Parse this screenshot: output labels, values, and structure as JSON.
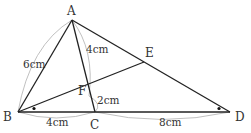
{
  "diagram": {
    "type": "geometry-figure",
    "points": {
      "A": {
        "label": "A",
        "x": 72,
        "y": 20
      },
      "B": {
        "label": "B",
        "x": 18,
        "y": 112
      },
      "C": {
        "label": "C",
        "x": 95,
        "y": 112
      },
      "D": {
        "label": "D",
        "x": 230,
        "y": 112
      },
      "E": {
        "label": "E",
        "x": 144,
        "y": 62
      },
      "F": {
        "label": "F",
        "x": 88,
        "y": 92
      }
    },
    "segments": [
      "AB",
      "AC",
      "AD",
      "BD",
      "BE"
    ],
    "measurements": {
      "AB": "6cm",
      "AF": "4cm",
      "FC": "2cm",
      "BC": "4cm",
      "CD": "8cm"
    },
    "angle_marks": [
      "angle EBD at B",
      "angle ADB at D"
    ],
    "colors": {
      "line": "#222222",
      "arc": "#aaaaaa",
      "text": "#333333"
    }
  }
}
